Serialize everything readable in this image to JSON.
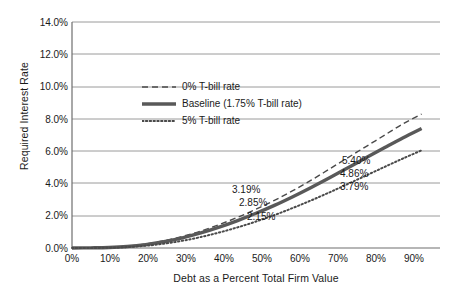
{
  "chart_data": {
    "type": "line",
    "title": "",
    "xlabel": "Debt as a Percent Total Firm Value",
    "ylabel": "Required Interest Rate",
    "xlim": [
      0,
      100
    ],
    "ylim": [
      0,
      14
    ],
    "grid": true,
    "x_ticks": [
      "0%",
      "10%",
      "20%",
      "30%",
      "40%",
      "50%",
      "60%",
      "70%",
      "80%",
      "90%"
    ],
    "x_tick_values": [
      0,
      10,
      20,
      30,
      40,
      50,
      60,
      70,
      80,
      90
    ],
    "y_ticks": [
      "0.0%",
      "2.0%",
      "4.0%",
      "6.0%",
      "8.0%",
      "10.0%",
      "12.0%",
      "14.0%"
    ],
    "y_tick_values": [
      0,
      2,
      4,
      6,
      8,
      10,
      12,
      14
    ],
    "legend_position": "center-left-inside",
    "x": [
      0,
      5,
      10,
      15,
      20,
      25,
      30,
      35,
      40,
      45,
      50,
      55,
      60,
      65,
      70,
      75,
      80,
      85,
      90,
      95
    ],
    "series": [
      {
        "name": "0% T-bill rate",
        "style": "dashed",
        "color": "#4a4a4a",
        "values": [
          0.0,
          0.01,
          0.04,
          0.11,
          0.25,
          0.45,
          0.72,
          1.05,
          1.45,
          1.9,
          2.4,
          2.95,
          3.55,
          4.2,
          4.9,
          5.6,
          6.3,
          7.0,
          7.7,
          8.3
        ]
      },
      {
        "name": "Baseline (1.75% T-bill rate)",
        "style": "solid",
        "color": "#595959",
        "values": [
          0.0,
          0.01,
          0.03,
          0.09,
          0.21,
          0.39,
          0.63,
          0.93,
          1.29,
          1.7,
          2.15,
          2.64,
          3.18,
          3.75,
          4.35,
          4.97,
          5.6,
          6.22,
          6.83,
          7.4
        ]
      },
      {
        "name": "5% T-bill rate",
        "style": "dotted",
        "color": "#4a4a4a",
        "values": [
          0.0,
          0.0,
          0.02,
          0.06,
          0.14,
          0.27,
          0.45,
          0.68,
          0.96,
          1.28,
          1.64,
          2.04,
          2.48,
          2.95,
          3.45,
          3.97,
          4.5,
          5.03,
          5.55,
          6.05
        ]
      }
    ],
    "annotations": [
      {
        "text": "3.19%",
        "series": "0% T-bill rate",
        "x": 55,
        "y": 2.95
      },
      {
        "text": "2.85%",
        "series": "Baseline (1.75% T-bill rate)",
        "x": 50,
        "y": 2.15
      },
      {
        "text": "2.15%",
        "series": "5% T-bill rate",
        "x": 47,
        "y": 1.45
      },
      {
        "text": "5.40%",
        "series": "0% T-bill rate",
        "x": 75,
        "y": 5.6
      },
      {
        "text": "4.86%",
        "series": "Baseline (1.75% T-bill rate)",
        "x": 73,
        "y": 4.86
      },
      {
        "text": "3.79%",
        "series": "5% T-bill rate",
        "x": 73,
        "y": 3.79
      }
    ]
  },
  "axes": {
    "y_title": "Required Interest Rate",
    "x_title": "Debt as a Percent Total Firm Value",
    "y_tick_labels": [
      "14.0%",
      "12.0%",
      "10.0%",
      "8.0%",
      "6.0%",
      "4.0%",
      "2.0%",
      "0.0%"
    ],
    "x_tick_labels": [
      "0%",
      "10%",
      "20%",
      "30%",
      "40%",
      "50%",
      "60%",
      "70%",
      "80%",
      "90%"
    ]
  },
  "legend": {
    "items": [
      {
        "label": "0% T-bill rate",
        "style": "dashed"
      },
      {
        "label": "Baseline (1.75% T-bill rate)",
        "style": "solid"
      },
      {
        "label": "5% T-bill rate",
        "style": "dotted"
      }
    ]
  },
  "data_labels": [
    {
      "text": "3.19%",
      "left": 232,
      "top": 184
    },
    {
      "text": "2.85%",
      "left": 239,
      "top": 197
    },
    {
      "text": "2.15%",
      "left": 247,
      "top": 211
    },
    {
      "text": "5.40%",
      "left": 342,
      "top": 155
    },
    {
      "text": "4.86%",
      "left": 340,
      "top": 168
    },
    {
      "text": "3.79%",
      "left": 340,
      "top": 181
    }
  ],
  "colors": {
    "axis": "#6e6e6e",
    "grid": "#9a9a9a",
    "line_dark": "#4a4a4a",
    "line_baseline": "#595959",
    "text": "#1a1a1a",
    "background": "#ffffff"
  }
}
